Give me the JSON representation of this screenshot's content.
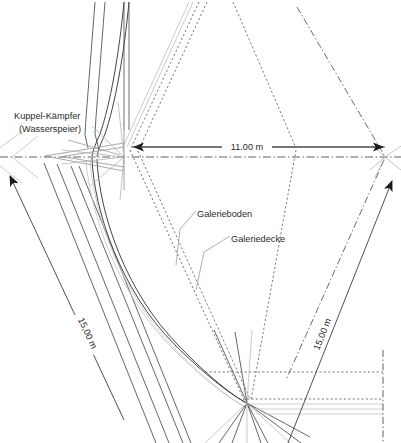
{
  "drawing": {
    "type": "architectural-plan",
    "background_color": "#ffffff",
    "line_color_dark": "#3a3a3a",
    "line_color_mid": "#6e6e6e",
    "line_color_light": "#b9b9b9",
    "line_color_faint": "#d6d6d6",
    "text_color": "#2b2b2b"
  },
  "annotations": {
    "kuppel_kaempfer_line1": "Kuppel-Kämpfer",
    "kuppel_kaempfer_line2": "(Wasserspeier)",
    "galerieboden": "Galerieboden",
    "galeriedecke": "Galeriedecke"
  },
  "dimensions": {
    "horizontal_width": "11.00 m",
    "left_diagonal": "15,00 m",
    "right_diagonal": "15,00 m"
  }
}
